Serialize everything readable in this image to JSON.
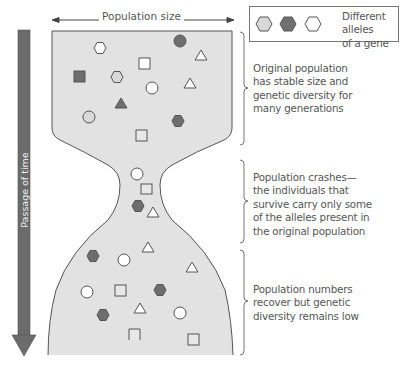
{
  "header": {
    "population_size_label": "Population size"
  },
  "time_axis": {
    "label": "Passage of time"
  },
  "legend": {
    "text_line1": "Different alleles",
    "text_line2": "of a gene",
    "allele_colors": [
      "#d8d8d8",
      "#707070",
      "#ffffff"
    ]
  },
  "annotations": {
    "original": [
      "Original population",
      "has stable size and",
      "genetic diversity for",
      "many generations"
    ],
    "crash": [
      "Population crashes—",
      "the individuals that",
      "survive carry only some",
      "of the alleles present in",
      "the original population"
    ],
    "recover": [
      "Population numbers",
      "recover but genetic",
      "diversity remains low"
    ]
  },
  "colors": {
    "population_fill": "#e2e2e2",
    "outline": "#555555",
    "dark": "#6e6e6e",
    "light": "#d9d9d9",
    "arrow": "#6b6b6b"
  }
}
